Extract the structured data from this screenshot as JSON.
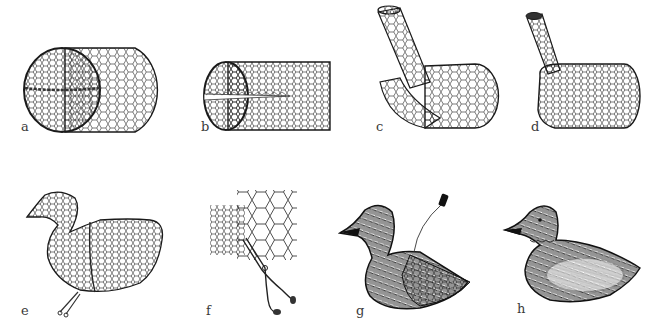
{
  "figure": {
    "colors": {
      "ink": "#1a1a1a",
      "background": "#ffffff",
      "label": "#3a3a3a"
    },
    "panels": [
      {
        "id": "a",
        "label": "a",
        "subject": "rolled chicken-wire cylinder with one end gathered closed"
      },
      {
        "id": "b",
        "label": "b",
        "subject": "cylinder end cut open into slit"
      },
      {
        "id": "c",
        "label": "c",
        "subject": "neck tube rolled up from cut end, front folded down"
      },
      {
        "id": "d",
        "label": "d",
        "subject": "body shaped with neck tube standing up"
      },
      {
        "id": "e",
        "label": "e",
        "subject": "full duck shape in mesh, pliers at base"
      },
      {
        "id": "f",
        "label": "f",
        "subject": "pliers twisting mesh ends together"
      },
      {
        "id": "g",
        "label": "g",
        "subject": "duck partly covered with feathers, thread spool"
      },
      {
        "id": "h",
        "label": "h",
        "subject": "finished feathered duck"
      }
    ]
  }
}
